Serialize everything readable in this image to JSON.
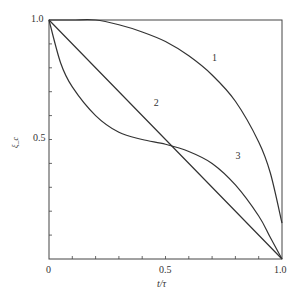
{
  "chart_data": {
    "type": "line",
    "title": "",
    "xlabel": "t/τ",
    "ylabel": "ξ_c",
    "xlim": [
      0,
      1.0
    ],
    "ylim": [
      0,
      1.0
    ],
    "x_ticks": [
      "0",
      "0.5",
      "1.0"
    ],
    "y_ticks": [
      "1.0",
      "0.5"
    ],
    "grid": false,
    "legend": "inline curve labels",
    "series": [
      {
        "name": "1",
        "x": [
          0,
          0.1,
          0.2,
          0.3,
          0.4,
          0.5,
          0.6,
          0.7,
          0.8,
          0.9,
          0.95,
          1.0
        ],
        "y": [
          1.0,
          1.0,
          1.0,
          0.98,
          0.95,
          0.91,
          0.85,
          0.77,
          0.66,
          0.49,
          0.36,
          0.15
        ]
      },
      {
        "name": "2",
        "x": [
          0,
          0.5,
          1.0
        ],
        "y": [
          1.0,
          0.5,
          0.0
        ]
      },
      {
        "name": "3",
        "x": [
          0,
          0.05,
          0.1,
          0.2,
          0.3,
          0.4,
          0.5,
          0.6,
          0.7,
          0.8,
          0.9,
          0.95,
          1.0
        ],
        "y": [
          1.0,
          0.82,
          0.72,
          0.6,
          0.53,
          0.5,
          0.48,
          0.45,
          0.4,
          0.31,
          0.18,
          0.09,
          0.0
        ]
      }
    ],
    "curve_labels": [
      {
        "text": "1",
        "x": 0.7,
        "y": 0.83
      },
      {
        "text": "2",
        "x": 0.45,
        "y": 0.64
      },
      {
        "text": "3",
        "x": 0.8,
        "y": 0.42
      }
    ]
  }
}
